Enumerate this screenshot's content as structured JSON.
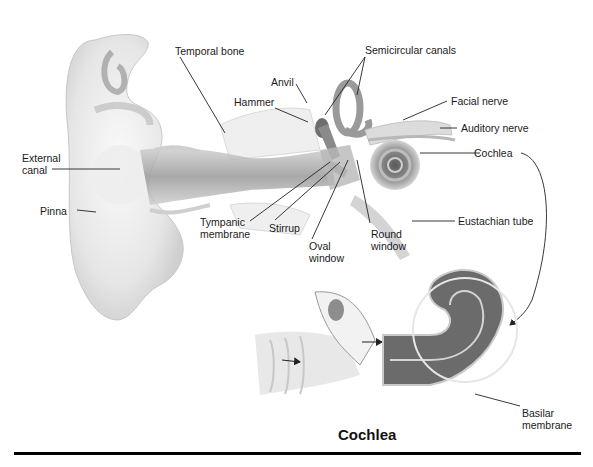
{
  "diagram": {
    "labels": {
      "temporal_bone": "Temporal bone",
      "semicircular_canals": "Semicircular canals",
      "anvil": "Anvil",
      "hammer": "Hammer",
      "facial_nerve": "Facial nerve",
      "auditory_nerve": "Auditory nerve",
      "external_canal_1": "External",
      "external_canal_2": "canal",
      "cochlea": "Cochlea",
      "pinna": "Pinna",
      "tympanic_membrane_1": "Tympanic",
      "tympanic_membrane_2": "membrane",
      "stirrup": "Stirrup",
      "oval_window_1": "Oval",
      "oval_window_2": "window",
      "round_window_1": "Round",
      "round_window_2": "window",
      "eustachian_tube": "Eustachian tube",
      "basilar_membrane_1": "Basilar",
      "basilar_membrane_2": "membrane"
    },
    "inset_title": "Cochlea",
    "colors": {
      "background": "#ffffff",
      "tissue_light": "#e9e9e9",
      "tissue_mid": "#bdbdbd",
      "tissue_dark": "#7a7a7a",
      "leader_line": "#222222",
      "rule": "#000000"
    }
  }
}
